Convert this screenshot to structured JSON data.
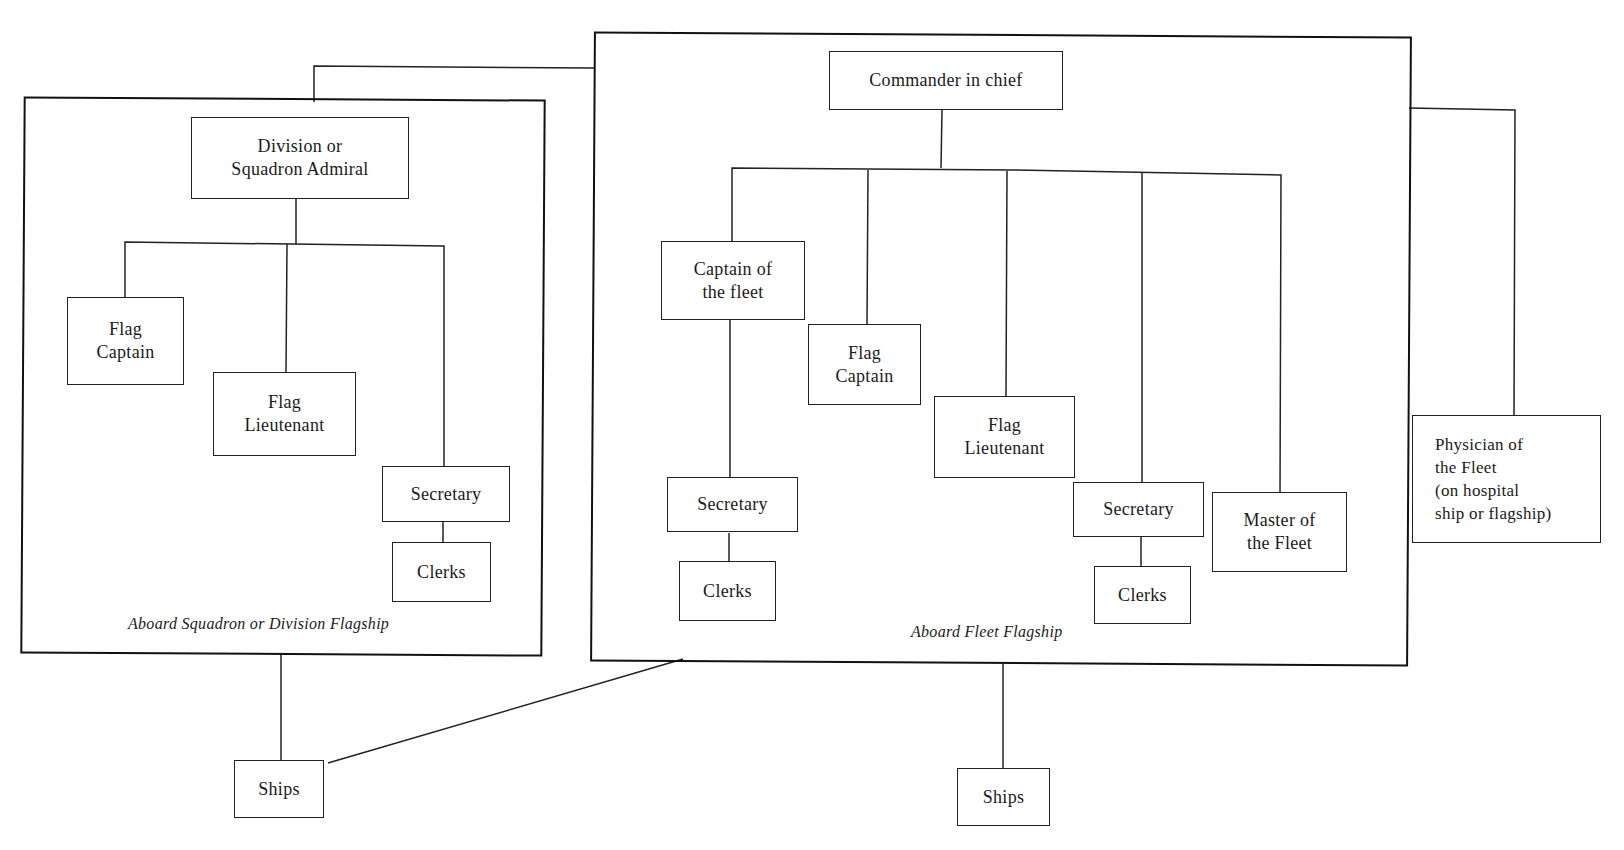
{
  "diagram": {
    "type": "organization-chart",
    "frames": {
      "squadron": {
        "caption": "Aboard Squadron or Division Flagship"
      },
      "fleet": {
        "caption": "Aboard Fleet Flagship"
      }
    },
    "squadron_nodes": {
      "admiral": "Division or\nSquadron Admiral",
      "flag_captain": "Flag\nCaptain",
      "flag_lieutenant": "Flag\nLieutenant",
      "secretary": "Secretary",
      "clerks": "Clerks",
      "ships": "Ships"
    },
    "fleet_nodes": {
      "commander": "Commander in chief",
      "captain_of_fleet": "Captain of\nthe fleet",
      "flag_captain": "Flag\nCaptain",
      "flag_lieutenant": "Flag\nLieutenant",
      "secretary_left": "Secretary",
      "clerks_left": "Clerks",
      "secretary_right": "Secretary",
      "clerks_right": "Clerks",
      "master_of_fleet": "Master of\nthe Fleet",
      "ships": "Ships"
    },
    "external_nodes": {
      "physician": "Physician of\nthe Fleet\n(on hospital\nship or flagship)"
    },
    "edges": [
      [
        "Commander in chief",
        "Division or Squadron Admiral (frame)"
      ],
      [
        "Commander in chief",
        "Physician of the Fleet"
      ],
      [
        "Commander in chief",
        "Captain of the fleet"
      ],
      [
        "Commander in chief",
        "Flag Captain"
      ],
      [
        "Commander in chief",
        "Flag Lieutenant"
      ],
      [
        "Commander in chief",
        "Secretary"
      ],
      [
        "Commander in chief",
        "Master of the Fleet"
      ],
      [
        "Captain of the fleet",
        "Secretary"
      ],
      [
        "Secretary",
        "Clerks"
      ],
      [
        "Division or Squadron Admiral",
        "Flag Captain"
      ],
      [
        "Division or Squadron Admiral",
        "Flag Lieutenant"
      ],
      [
        "Division or Squadron Admiral",
        "Secretary"
      ],
      [
        "Secretary",
        "Clerks"
      ],
      [
        "Squadron Flagship",
        "Ships"
      ],
      [
        "Fleet Flagship",
        "Ships (squadron)"
      ],
      [
        "Fleet Flagship",
        "Ships"
      ]
    ]
  }
}
